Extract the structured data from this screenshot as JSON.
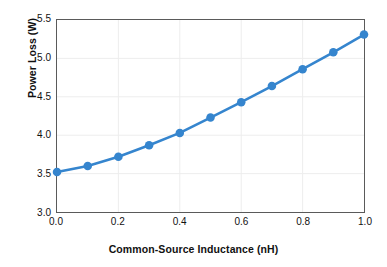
{
  "chart_data": {
    "type": "line",
    "title": "",
    "xlabel": "Common-Source Inductance (nH)",
    "ylabel": "Power Loss (W)",
    "xlim": [
      0.0,
      1.0
    ],
    "ylim": [
      3.0,
      5.5
    ],
    "xticks": [
      "0.0",
      "0.2",
      "0.4",
      "0.6",
      "0.8",
      "1.0"
    ],
    "xtick_values": [
      0.0,
      0.2,
      0.4,
      0.6,
      0.8,
      1.0
    ],
    "yticks": [
      "3.0",
      "3.5",
      "4.0",
      "4.5",
      "5.0",
      "5.5"
    ],
    "ytick_values": [
      3.0,
      3.5,
      4.0,
      4.5,
      5.0,
      5.5
    ],
    "grid": true,
    "grid_color": "#ededed",
    "legend": null,
    "series_color": "#3585ce",
    "marker": "circle",
    "x": [
      0.0,
      0.1,
      0.2,
      0.3,
      0.4,
      0.5,
      0.6,
      0.7,
      0.8,
      0.9,
      1.0
    ],
    "values": [
      3.52,
      3.6,
      3.72,
      3.87,
      4.03,
      4.23,
      4.43,
      4.64,
      4.86,
      5.08,
      5.31
    ],
    "series": [
      {
        "name": "Power Loss",
        "values": [
          3.52,
          3.6,
          3.72,
          3.87,
          4.03,
          4.23,
          4.43,
          4.64,
          4.86,
          5.08,
          5.31
        ]
      }
    ]
  }
}
